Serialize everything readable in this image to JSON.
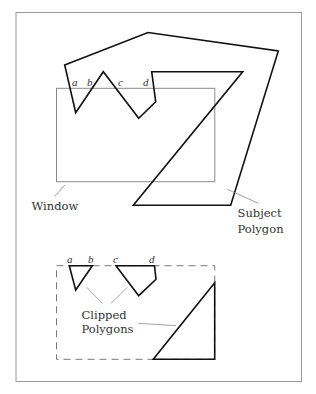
{
  "figure": {
    "top": {
      "labels": {
        "a": "a",
        "b": "b",
        "c": "c",
        "d": "d",
        "window": "Window",
        "subject_line1": "Subject",
        "subject_line2": "Polygon"
      }
    },
    "bottom": {
      "labels": {
        "a": "a",
        "b": "b",
        "c": "c",
        "d": "d",
        "clipped_line1": "Clipped",
        "clipped_line2": "Polygons"
      }
    }
  },
  "colors": {
    "polygon_stroke": "#111111",
    "window_stroke": "#8a8a8a",
    "frame_stroke": "#9a9a9a",
    "leader_stroke": "#8a8a8a"
  }
}
